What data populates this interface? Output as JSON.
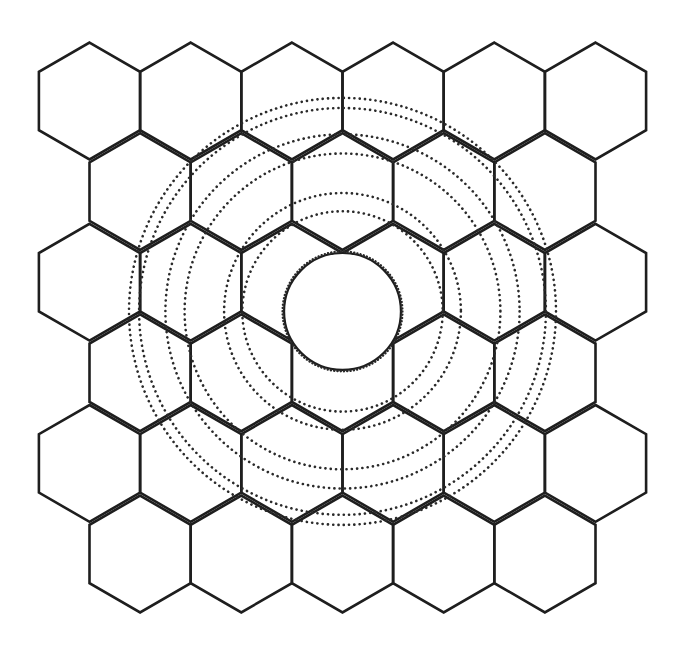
{
  "diagram": {
    "title": "",
    "colors": {
      "background": "#ffffff",
      "line": "#1e1e1e",
      "dots": "#2a2a2a"
    },
    "grid": {
      "orientation": "pointy-top",
      "rows": [
        {
          "row": 1,
          "cells": 6,
          "offset": "none"
        },
        {
          "row": 2,
          "cells": 5,
          "offset": "half-cell"
        },
        {
          "row": 3,
          "cells": 6,
          "offset": "none"
        },
        {
          "row": 4,
          "cells": 5,
          "offset": "half-cell"
        },
        {
          "row": 5,
          "cells": 6,
          "offset": "none"
        },
        {
          "row": 6,
          "cells": 5,
          "offset": "half-cell"
        }
      ],
      "total_cells": 33
    },
    "central_element": {
      "shape": "circle",
      "position": "vertex shared by row 3 cells 3-4 and row 4 cell 3",
      "outline": "solid with dotted edge"
    },
    "rings": {
      "count": 6,
      "style": "dotted",
      "grouping": "three pairs",
      "relative_radii_in_cell_widths": [
        0.99,
        1.17,
        1.56,
        1.75,
        2.01,
        2.11
      ]
    }
  }
}
